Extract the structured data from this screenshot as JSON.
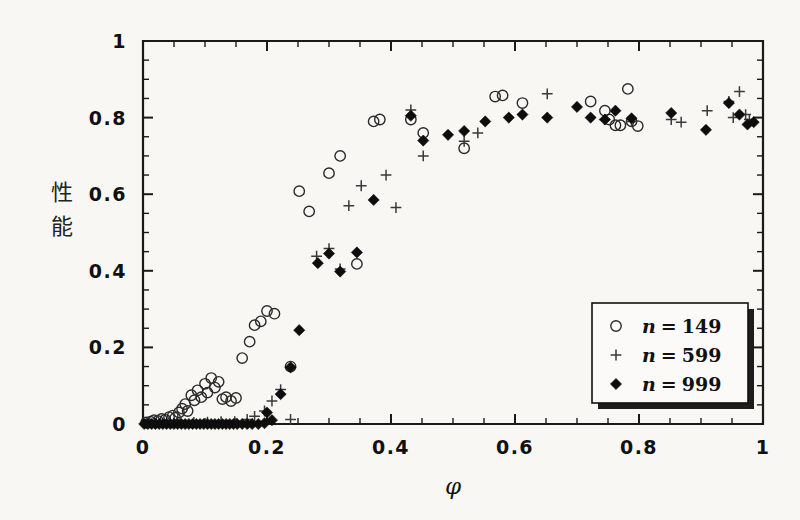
{
  "figure": {
    "background_color": "#f8f7f4",
    "ink_color": "#111111"
  },
  "chart_data": {
    "type": "scatter",
    "title": "",
    "subtitle": "",
    "xlabel": "φ",
    "ylabel": "性能",
    "ylabel_chars": [
      "性",
      "能"
    ],
    "xlim": [
      0,
      1
    ],
    "ylim": [
      0,
      1
    ],
    "grid": false,
    "xticks": [
      0,
      0.2,
      0.4,
      0.6,
      0.8,
      1
    ],
    "xticklabels": [
      "0",
      "0.2",
      "0.4",
      "0.6",
      "0.8",
      "1"
    ],
    "yticks": [
      0,
      0.2,
      0.4,
      0.6,
      0.8,
      1
    ],
    "yticklabels": [
      "0",
      "0.2",
      "0.4",
      "0.6",
      "0.8",
      "1"
    ],
    "minor_tick_step": 0.05,
    "legend_position": "lower right",
    "series": [
      {
        "name": "n = 149",
        "label_var": "n",
        "label_value": "149",
        "marker": "open-circle",
        "color": "#2a2a2a",
        "points": [
          [
            0.005,
            0.004
          ],
          [
            0.012,
            0.006
          ],
          [
            0.018,
            0.01
          ],
          [
            0.024,
            0.008
          ],
          [
            0.03,
            0.013
          ],
          [
            0.036,
            0.011
          ],
          [
            0.042,
            0.018
          ],
          [
            0.048,
            0.022
          ],
          [
            0.052,
            0.016
          ],
          [
            0.058,
            0.03
          ],
          [
            0.063,
            0.04
          ],
          [
            0.068,
            0.052
          ],
          [
            0.072,
            0.034
          ],
          [
            0.078,
            0.075
          ],
          [
            0.083,
            0.062
          ],
          [
            0.088,
            0.088
          ],
          [
            0.094,
            0.07
          ],
          [
            0.1,
            0.105
          ],
          [
            0.104,
            0.082
          ],
          [
            0.11,
            0.12
          ],
          [
            0.116,
            0.095
          ],
          [
            0.122,
            0.11
          ],
          [
            0.128,
            0.065
          ],
          [
            0.134,
            0.07
          ],
          [
            0.142,
            0.06
          ],
          [
            0.15,
            0.068
          ],
          [
            0.16,
            0.172
          ],
          [
            0.172,
            0.215
          ],
          [
            0.18,
            0.258
          ],
          [
            0.19,
            0.268
          ],
          [
            0.2,
            0.295
          ],
          [
            0.212,
            0.288
          ],
          [
            0.238,
            0.15
          ],
          [
            0.252,
            0.608
          ],
          [
            0.268,
            0.555
          ],
          [
            0.3,
            0.655
          ],
          [
            0.318,
            0.7
          ],
          [
            0.345,
            0.418
          ],
          [
            0.372,
            0.79
          ],
          [
            0.382,
            0.795
          ],
          [
            0.432,
            0.795
          ],
          [
            0.452,
            0.76
          ],
          [
            0.518,
            0.72
          ],
          [
            0.568,
            0.855
          ],
          [
            0.58,
            0.858
          ],
          [
            0.612,
            0.838
          ],
          [
            0.722,
            0.842
          ],
          [
            0.745,
            0.818
          ],
          [
            0.752,
            0.795
          ],
          [
            0.762,
            0.78
          ],
          [
            0.77,
            0.78
          ],
          [
            0.782,
            0.875
          ],
          [
            0.788,
            0.79
          ],
          [
            0.798,
            0.778
          ]
        ]
      },
      {
        "name": "n = 599",
        "label_var": "n",
        "label_value": "599",
        "marker": "plus",
        "color": "#3a3a3a",
        "points": [
          [
            0.006,
            0.002
          ],
          [
            0.02,
            0.002
          ],
          [
            0.038,
            0.003
          ],
          [
            0.06,
            0.004
          ],
          [
            0.082,
            0.004
          ],
          [
            0.104,
            0.005
          ],
          [
            0.126,
            0.006
          ],
          [
            0.148,
            0.006
          ],
          [
            0.168,
            0.012
          ],
          [
            0.18,
            0.02
          ],
          [
            0.196,
            0.034
          ],
          [
            0.208,
            0.06
          ],
          [
            0.222,
            0.09
          ],
          [
            0.238,
            0.012
          ],
          [
            0.28,
            0.438
          ],
          [
            0.3,
            0.458
          ],
          [
            0.318,
            0.405
          ],
          [
            0.332,
            0.57
          ],
          [
            0.352,
            0.622
          ],
          [
            0.392,
            0.65
          ],
          [
            0.408,
            0.565
          ],
          [
            0.432,
            0.82
          ],
          [
            0.452,
            0.7
          ],
          [
            0.518,
            0.738
          ],
          [
            0.54,
            0.76
          ],
          [
            0.652,
            0.862
          ],
          [
            0.745,
            0.795
          ],
          [
            0.788,
            0.79
          ],
          [
            0.852,
            0.795
          ],
          [
            0.868,
            0.788
          ],
          [
            0.91,
            0.818
          ],
          [
            0.945,
            0.842
          ],
          [
            0.952,
            0.8
          ],
          [
            0.962,
            0.868
          ],
          [
            0.972,
            0.808
          ],
          [
            0.978,
            0.795
          ]
        ]
      },
      {
        "name": "n = 999",
        "label_var": "n",
        "label_value": "999",
        "marker": "filled-diamond",
        "color": "#0d0d0d",
        "points": [
          [
            0.002,
            0.0
          ],
          [
            0.008,
            0.0
          ],
          [
            0.014,
            0.0
          ],
          [
            0.02,
            0.0
          ],
          [
            0.026,
            0.0
          ],
          [
            0.032,
            0.0
          ],
          [
            0.038,
            0.0
          ],
          [
            0.044,
            0.0
          ],
          [
            0.05,
            0.0
          ],
          [
            0.056,
            0.0
          ],
          [
            0.062,
            0.0
          ],
          [
            0.068,
            0.0
          ],
          [
            0.074,
            0.0
          ],
          [
            0.08,
            0.0
          ],
          [
            0.086,
            0.0
          ],
          [
            0.092,
            0.0
          ],
          [
            0.098,
            0.0
          ],
          [
            0.104,
            0.0
          ],
          [
            0.11,
            0.0
          ],
          [
            0.116,
            0.0
          ],
          [
            0.122,
            0.0
          ],
          [
            0.128,
            0.0
          ],
          [
            0.134,
            0.0
          ],
          [
            0.14,
            0.0
          ],
          [
            0.146,
            0.0
          ],
          [
            0.152,
            0.0
          ],
          [
            0.16,
            0.0
          ],
          [
            0.168,
            0.0
          ],
          [
            0.176,
            0.0
          ],
          [
            0.186,
            0.0
          ],
          [
            0.196,
            0.002
          ],
          [
            0.2,
            0.03
          ],
          [
            0.208,
            0.01
          ],
          [
            0.222,
            0.078
          ],
          [
            0.238,
            0.148
          ],
          [
            0.252,
            0.245
          ],
          [
            0.282,
            0.42
          ],
          [
            0.3,
            0.445
          ],
          [
            0.318,
            0.398
          ],
          [
            0.345,
            0.448
          ],
          [
            0.372,
            0.585
          ],
          [
            0.432,
            0.805
          ],
          [
            0.452,
            0.74
          ],
          [
            0.492,
            0.755
          ],
          [
            0.518,
            0.765
          ],
          [
            0.552,
            0.79
          ],
          [
            0.59,
            0.8
          ],
          [
            0.612,
            0.808
          ],
          [
            0.652,
            0.8
          ],
          [
            0.7,
            0.828
          ],
          [
            0.722,
            0.8
          ],
          [
            0.745,
            0.795
          ],
          [
            0.762,
            0.818
          ],
          [
            0.788,
            0.798
          ],
          [
            0.852,
            0.812
          ],
          [
            0.908,
            0.768
          ],
          [
            0.945,
            0.838
          ],
          [
            0.962,
            0.808
          ],
          [
            0.975,
            0.782
          ],
          [
            0.985,
            0.788
          ]
        ]
      }
    ]
  }
}
